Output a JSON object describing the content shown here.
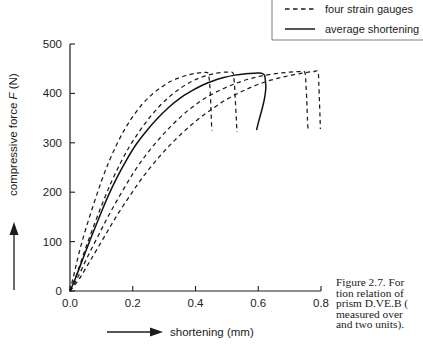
{
  "figure": {
    "caption_lines": [
      "Figure 2.7. For",
      "tion relation of",
      "prism D.VE.B (",
      "measured over",
      "and two units)."
    ]
  },
  "legend": {
    "items": [
      {
        "label": "four strain gauges",
        "style": "dashed"
      },
      {
        "label": "average shortening",
        "style": "solid"
      }
    ]
  },
  "axes": {
    "x_label": "shortening (mm)",
    "y_label_prefix": "compressive force ",
    "y_label_symbol": "F",
    "y_label_suffix": " (N)",
    "x_ticks": [
      "0.0",
      "0.2",
      "0.4",
      "0.6",
      "0.8"
    ],
    "y_ticks": [
      "0",
      "100",
      "200",
      "300",
      "400",
      "500"
    ]
  },
  "chart_data": {
    "type": "line",
    "xlabel": "shortening (mm)",
    "ylabel": "compressive force F (N)",
    "xlim": [
      0.0,
      0.8
    ],
    "ylim": [
      0,
      500
    ],
    "xticks": [
      0.0,
      0.2,
      0.4,
      0.6,
      0.8
    ],
    "yticks": [
      0,
      100,
      200,
      300,
      400,
      500
    ],
    "grid": false,
    "legend_position": "top-right",
    "series": [
      {
        "name": "strain gauge 1",
        "style": "dashed",
        "legend": "four strain gauges",
        "points": [
          [
            0.0,
            0
          ],
          [
            0.015,
            40
          ],
          [
            0.03,
            80
          ],
          [
            0.05,
            125
          ],
          [
            0.075,
            175
          ],
          [
            0.1,
            222
          ],
          [
            0.125,
            263
          ],
          [
            0.15,
            298
          ],
          [
            0.175,
            328
          ],
          [
            0.2,
            353
          ],
          [
            0.23,
            378
          ],
          [
            0.26,
            397
          ],
          [
            0.29,
            412
          ],
          [
            0.32,
            424
          ],
          [
            0.35,
            432
          ],
          [
            0.38,
            438
          ],
          [
            0.405,
            441
          ],
          [
            0.425,
            442
          ],
          [
            0.44,
            441
          ],
          [
            0.445,
            420
          ],
          [
            0.448,
            390
          ],
          [
            0.45,
            355
          ],
          [
            0.452,
            325
          ]
        ]
      },
      {
        "name": "strain gauge 2",
        "style": "dashed",
        "legend": "four strain gauges",
        "points": [
          [
            0.0,
            0
          ],
          [
            0.02,
            32
          ],
          [
            0.045,
            78
          ],
          [
            0.07,
            122
          ],
          [
            0.1,
            172
          ],
          [
            0.13,
            218
          ],
          [
            0.16,
            258
          ],
          [
            0.19,
            293
          ],
          [
            0.22,
            322
          ],
          [
            0.25,
            348
          ],
          [
            0.285,
            374
          ],
          [
            0.32,
            395
          ],
          [
            0.355,
            412
          ],
          [
            0.39,
            425
          ],
          [
            0.425,
            434
          ],
          [
            0.46,
            440
          ],
          [
            0.49,
            443
          ],
          [
            0.51,
            443
          ],
          [
            0.52,
            441
          ],
          [
            0.524,
            420
          ],
          [
            0.527,
            385
          ],
          [
            0.53,
            350
          ],
          [
            0.532,
            322
          ]
        ]
      },
      {
        "name": "strain gauge 3",
        "style": "dashed",
        "legend": "four strain gauges",
        "points": [
          [
            0.0,
            0
          ],
          [
            0.025,
            28
          ],
          [
            0.055,
            68
          ],
          [
            0.09,
            112
          ],
          [
            0.125,
            155
          ],
          [
            0.165,
            200
          ],
          [
            0.205,
            242
          ],
          [
            0.245,
            278
          ],
          [
            0.29,
            312
          ],
          [
            0.335,
            342
          ],
          [
            0.385,
            370
          ],
          [
            0.435,
            392
          ],
          [
            0.49,
            410
          ],
          [
            0.545,
            424
          ],
          [
            0.6,
            434
          ],
          [
            0.655,
            440
          ],
          [
            0.7,
            443
          ],
          [
            0.73,
            444
          ],
          [
            0.748,
            443
          ],
          [
            0.752,
            418
          ],
          [
            0.755,
            380
          ],
          [
            0.757,
            345
          ],
          [
            0.759,
            325
          ]
        ]
      },
      {
        "name": "strain gauge 4",
        "style": "dashed",
        "legend": "four strain gauges",
        "points": [
          [
            0.0,
            0
          ],
          [
            0.03,
            25
          ],
          [
            0.065,
            62
          ],
          [
            0.105,
            105
          ],
          [
            0.145,
            148
          ],
          [
            0.19,
            192
          ],
          [
            0.235,
            233
          ],
          [
            0.285,
            272
          ],
          [
            0.335,
            306
          ],
          [
            0.39,
            338
          ],
          [
            0.445,
            365
          ],
          [
            0.505,
            390
          ],
          [
            0.565,
            409
          ],
          [
            0.625,
            424
          ],
          [
            0.685,
            434
          ],
          [
            0.74,
            441
          ],
          [
            0.775,
            444
          ],
          [
            0.79,
            444
          ],
          [
            0.793,
            420
          ],
          [
            0.795,
            385
          ],
          [
            0.797,
            350
          ],
          [
            0.798,
            328
          ]
        ]
      },
      {
        "name": "average shortening",
        "style": "solid",
        "legend": "average shortening",
        "points": [
          [
            0.0,
            0
          ],
          [
            0.02,
            30
          ],
          [
            0.045,
            72
          ],
          [
            0.07,
            113
          ],
          [
            0.095,
            152
          ],
          [
            0.12,
            190
          ],
          [
            0.15,
            230
          ],
          [
            0.18,
            265
          ],
          [
            0.21,
            296
          ],
          [
            0.245,
            325
          ],
          [
            0.28,
            350
          ],
          [
            0.315,
            372
          ],
          [
            0.35,
            390
          ],
          [
            0.385,
            404
          ],
          [
            0.42,
            416
          ],
          [
            0.455,
            425
          ],
          [
            0.49,
            432
          ],
          [
            0.525,
            437
          ],
          [
            0.56,
            440
          ],
          [
            0.59,
            441
          ],
          [
            0.61,
            441
          ],
          [
            0.62,
            437
          ],
          [
            0.623,
            424
          ],
          [
            0.624,
            410
          ],
          [
            0.62,
            390
          ],
          [
            0.612,
            368
          ],
          [
            0.602,
            345
          ],
          [
            0.595,
            327
          ]
        ]
      }
    ]
  }
}
